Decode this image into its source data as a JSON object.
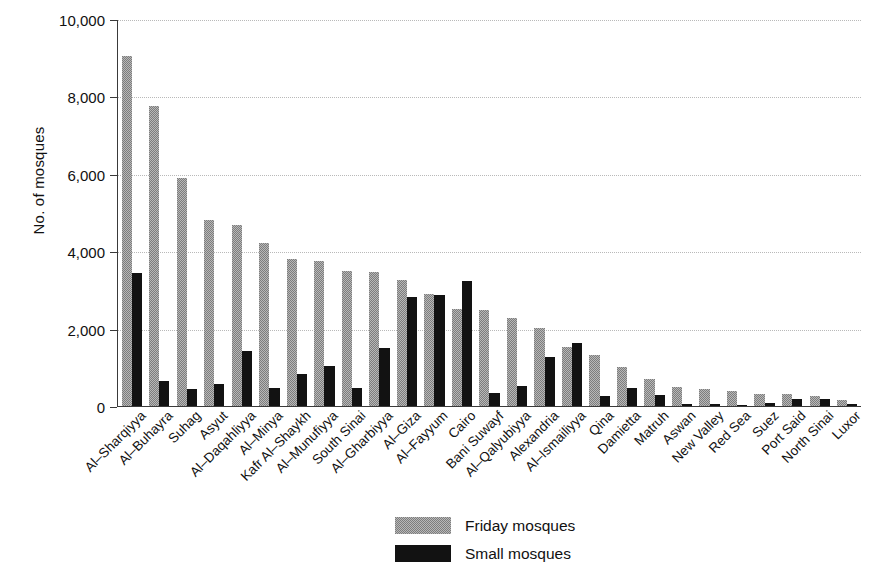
{
  "chart_data": {
    "type": "bar",
    "title": "",
    "subtitle": "",
    "xlabel": "",
    "ylabel": "No. of mosques",
    "ylim": [
      0,
      10000
    ],
    "ytick_values": [
      0,
      2000,
      4000,
      6000,
      8000,
      10000
    ],
    "ytick_labels": [
      "0",
      "2,000",
      "4,000",
      "6,000",
      "8,000",
      "10,000"
    ],
    "grid": "horizontal-dotted",
    "legend_position": "bottom-center",
    "categories": [
      "Al–Sharqiyya",
      "Al–Buhayra",
      "Suhag",
      "Asyut",
      "Al–Daqahliyya",
      "Al–Minya",
      "Kafr Al–Shaykh",
      "Al–Munufiyya",
      "South Sinai",
      "Al–Gharbiyya",
      "Al–Giza",
      "Al–Fayyum",
      "Cairo",
      "Bani Suwayf",
      "Al–Qalyubiyya",
      "Alexandria",
      "Al–Ismailiyya",
      "Qina",
      "Damietta",
      "Matruh",
      "Aswan",
      "New Valley",
      "Red Sea",
      "Suez",
      "Port Said",
      "North Sinai",
      "Luxor"
    ],
    "series": [
      {
        "name": "Friday mosques",
        "color": "#7d7d7d",
        "values": [
          9050,
          7760,
          5880,
          4810,
          4680,
          4200,
          3800,
          3740,
          3480,
          3460,
          3250,
          2900,
          2510,
          2470,
          2270,
          2010,
          1520,
          1320,
          1000,
          700,
          500,
          430,
          380,
          300,
          300,
          250,
          160
        ]
      },
      {
        "name": "Small mosques",
        "color": "#121212",
        "values": [
          3450,
          650,
          440,
          580,
          1420,
          460,
          820,
          1040,
          460,
          1490,
          2820,
          2870,
          3220,
          330,
          510,
          1270,
          1630,
          250,
          470,
          280,
          60,
          40,
          20,
          90,
          190,
          170,
          40
        ]
      }
    ]
  },
  "legend": {
    "entries": [
      {
        "label": "Friday mosques",
        "swatch": "friday"
      },
      {
        "label": "Small mosques",
        "swatch": "small"
      }
    ]
  }
}
